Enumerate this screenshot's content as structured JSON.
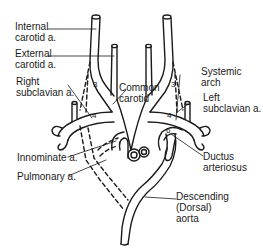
{
  "diagram": {
    "title": "",
    "labels": {
      "internal_carotid": "Internal\ncarotid a.",
      "external_carotid": "External\ncarotid a.",
      "right_subclavian": "Right\nsubclavian a.",
      "common_carotid": "Common\ncarotid",
      "systemic_arch": "Systemic\narch",
      "left_subclavian": "Left\nsubclavian a.",
      "innominate": "Innominate a.",
      "pulmonary": "Pulmonary a.",
      "ductus_arteriosus": "Ductus\narteriosus",
      "descending_aorta": "Descending\n(Dorsal)\naorta"
    },
    "arch_numbers": {
      "right_3": "3",
      "left_3": "3",
      "right_4": "4",
      "left_4": "4",
      "left_6": "6"
    },
    "colors": {
      "line": "#1a1a1a",
      "background": "#ffffff"
    }
  }
}
